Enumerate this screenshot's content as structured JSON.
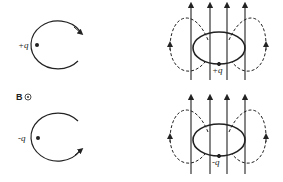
{
  "diagram": {
    "field_label": "B",
    "field_symbol": "out-of-page (⊙)",
    "panels": [
      {
        "id": "top-left",
        "charge_label": "+q",
        "description": "positive charge orbit, clockwise arrow at top right"
      },
      {
        "id": "top-right",
        "charge_label": "+q",
        "description": "orbit loop with vertical field lines and dashed return loops"
      },
      {
        "id": "bottom-left",
        "charge_label": "-q",
        "description": "negative charge orbit, arrow at bottom right"
      },
      {
        "id": "bottom-right",
        "charge_label": "-q",
        "description": "orbit loop with vertical field lines and dashed return loops"
      }
    ]
  },
  "labels": {
    "plus_q": "+q",
    "minus_q": "-q",
    "B": "B"
  },
  "colors": {
    "ink": "#222222",
    "background": "#ffffff"
  }
}
